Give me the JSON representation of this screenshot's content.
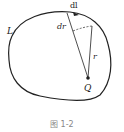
{
  "figure": {
    "caption": "图 1-2",
    "labels": {
      "curve": "L",
      "element": "dl",
      "radial_increment": "dr",
      "radius": "r",
      "charge": "Q"
    },
    "colors": {
      "stroke": "#222222",
      "background": "#ffffff",
      "caption": "#888888"
    }
  }
}
